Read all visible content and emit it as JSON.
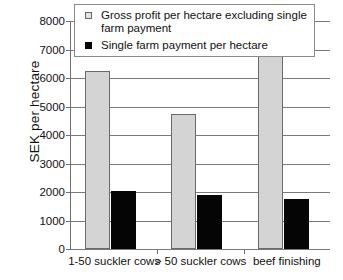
{
  "chart_data": {
    "type": "bar",
    "title": "",
    "xlabel": "",
    "ylabel": "SEK per hectare",
    "ylim": [
      0,
      8000
    ],
    "ytick_step": 1000,
    "yticks": [
      "8000",
      "7000",
      "6000",
      "5000",
      "4000",
      "3000",
      "2000",
      "1000",
      "0"
    ],
    "grid": true,
    "legend_position": "top-center-inside",
    "categories": [
      "1-50 suckler cows",
      "> 50 suckler cows",
      "beef finishing"
    ],
    "series": [
      {
        "name": "Gross profit per hectare excluding single farm payment",
        "color": "#d4d4d4",
        "values": [
          6230,
          4730,
          7460
        ]
      },
      {
        "name": "Single farm payment per hectare",
        "color": "#050505",
        "values": [
          2040,
          1890,
          1760
        ]
      }
    ]
  },
  "legend": {
    "items": [
      {
        "label": "Gross profit per hectare excluding single farm payment",
        "swatch": "gross-profit-swatch"
      },
      {
        "label": "Single farm payment per hectare",
        "swatch": "single-farm-payment-swatch"
      }
    ]
  },
  "axes": {
    "y_title": "SEK per hectare",
    "y_labels": [
      "8000",
      "7000",
      "6000",
      "5000",
      "4000",
      "3000",
      "2000",
      "1000",
      "0"
    ],
    "x_labels": [
      "1-50 suckler cows",
      "> 50 suckler cows",
      "beef finishing"
    ]
  },
  "colors": {
    "gross_profit": "#d4d4d4",
    "single_farm_payment": "#050505",
    "grid": "#7a7a7a",
    "axis": "#6f6f6f",
    "background": "#ffffff"
  }
}
